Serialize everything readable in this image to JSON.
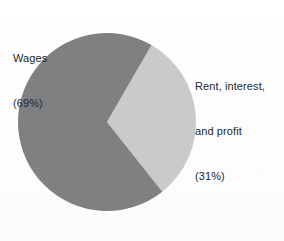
{
  "figure": {
    "background_color": "#fdfdfd",
    "text_color": "#25262a"
  },
  "chart_data": {
    "type": "pie",
    "title": "",
    "subtitle": "",
    "xlabel": "",
    "ylabel": "",
    "grid": false,
    "legend_position": "none",
    "labels_position": "outside-callout",
    "center": {
      "x": 107,
      "y": 122
    },
    "radius": 89,
    "start_angle_deg": 30,
    "direction": "counterclockwise",
    "categories": [
      "Wages",
      "Rent, interest, and profit"
    ],
    "values": [
      69,
      31
    ],
    "value_unit": "percent",
    "colors": [
      "#7e8082",
      "#c9cacb"
    ],
    "slices": [
      {
        "name": "Wages",
        "value": 69,
        "color": "#7e8082",
        "label_lines": [
          "Wages",
          "(69%)"
        ]
      },
      {
        "name": "Rent, interest, and profit",
        "value": 31,
        "color": "#c9cacb",
        "label_lines": [
          "Rent, interest,",
          "and profit",
          "(31%)"
        ]
      }
    ]
  },
  "labels": {
    "wages": {
      "line1": "Wages",
      "line2": "(69%)"
    },
    "rent": {
      "line1": "Rent, interest,",
      "line2": "and profit",
      "line3": "(31%)"
    }
  }
}
